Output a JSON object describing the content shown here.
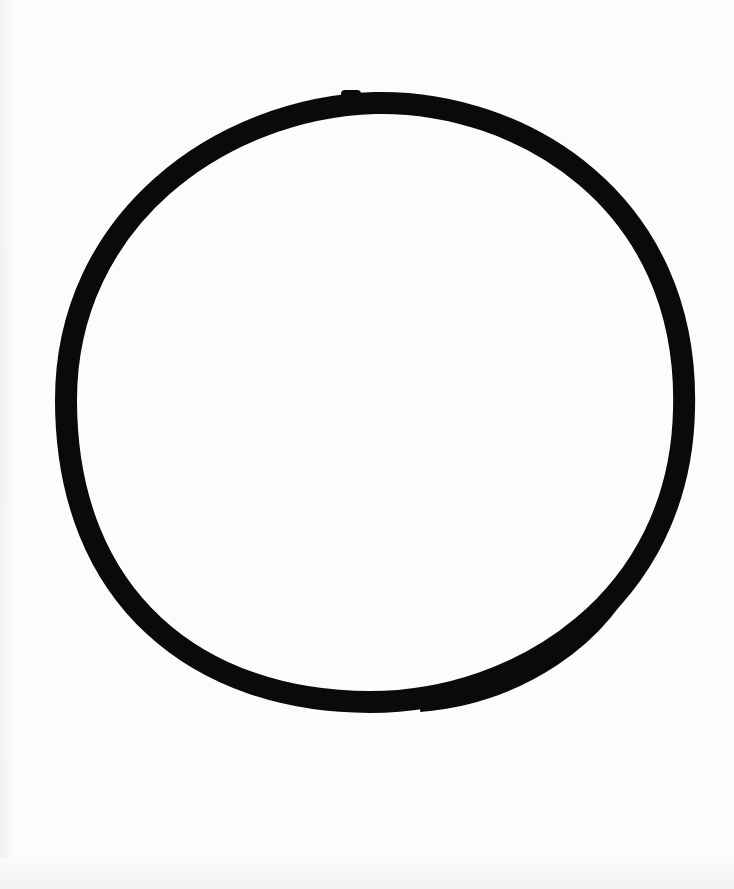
{
  "image": {
    "subject": "hand-drawn black brush-stroke circle (ensō) on white paper",
    "background_color": "#fcfcfc",
    "stroke_color": "#0a0a0a"
  }
}
